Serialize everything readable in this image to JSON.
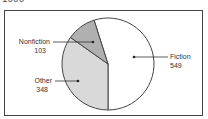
{
  "header": {
    "clipped_text": "1000"
  },
  "chart_data": {
    "type": "pie",
    "title": "",
    "categories": [
      "Fiction",
      "Other",
      "Nonfiction"
    ],
    "values": [
      549,
      348,
      103
    ],
    "total": 1000,
    "colors": [
      "#ffffff",
      "#d9d9d9",
      "#b0b0b0"
    ],
    "labels": [
      {
        "name": "Fiction",
        "value": "549"
      },
      {
        "name": "Other",
        "value": "348"
      },
      {
        "name": "Nonfiction",
        "value": "103"
      }
    ],
    "legend": "none (callout labels)"
  }
}
